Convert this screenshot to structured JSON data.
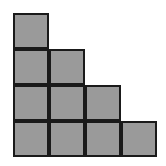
{
  "diagram": {
    "type": "staircase-squares",
    "fill_color": "#9a9a9a",
    "stroke_color": "#1a1a1a",
    "cell_size": 36,
    "origin": [
      13,
      13
    ],
    "row_counts": [
      1,
      2,
      3,
      4
    ],
    "total_squares": 10
  }
}
